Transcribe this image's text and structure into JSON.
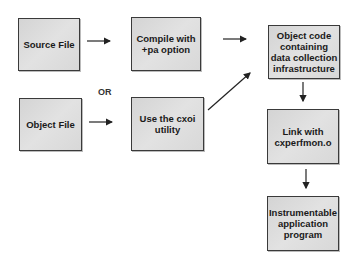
{
  "diagram": {
    "type": "flowchart",
    "nodes": [
      {
        "id": "source_file",
        "label": "Source File"
      },
      {
        "id": "compile",
        "label": "Compile with +pa option"
      },
      {
        "id": "object_file",
        "label": "Object File"
      },
      {
        "id": "cxoi",
        "label": "Use the cxoi utility"
      },
      {
        "id": "object_code",
        "label": "Object code containing data collection infrastructure"
      },
      {
        "id": "link",
        "label": "Link with cxperfmon.o"
      },
      {
        "id": "instrumentable",
        "label": "Instrumentable application program"
      }
    ],
    "edges": [
      {
        "from": "source_file",
        "to": "compile"
      },
      {
        "from": "object_file",
        "to": "cxoi"
      },
      {
        "from": "compile",
        "to": "object_code"
      },
      {
        "from": "cxoi",
        "to": "object_code"
      },
      {
        "from": "object_code",
        "to": "link"
      },
      {
        "from": "link",
        "to": "instrumentable"
      }
    ],
    "or_label": "OR",
    "colors": {
      "box_fill": "#dcdcdc",
      "box_border": "#3a3a3a",
      "arrow": "#222222"
    }
  }
}
